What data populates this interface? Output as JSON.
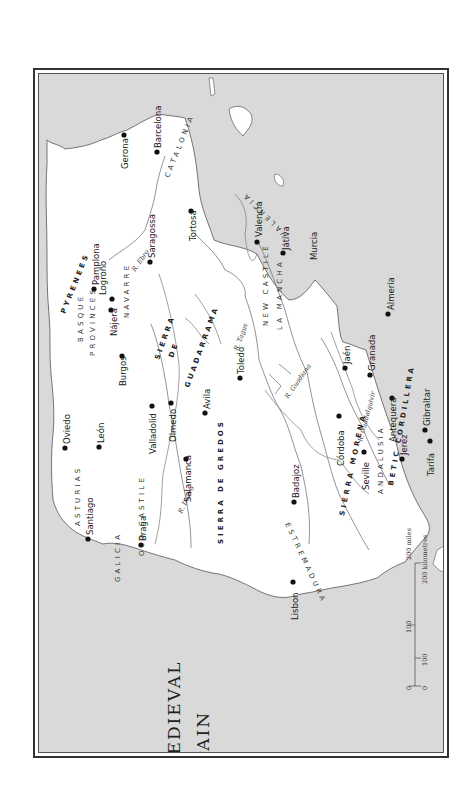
{
  "map": {
    "title_line1": "Medieval",
    "title_line2": "Spain",
    "orientation": "rotated 90° counter-clockwise (north to the left)",
    "colors": {
      "sea": "#d9d9d9",
      "land": "#ffffff",
      "border": "#333333",
      "river": "#777777",
      "city_dot": "#111111"
    },
    "cities": [
      {
        "name": "Barcelona"
      },
      {
        "name": "Gerona"
      },
      {
        "name": "Tortosa"
      },
      {
        "name": "Valencia"
      },
      {
        "name": "Játiva"
      },
      {
        "name": "Saragossa"
      },
      {
        "name": "Pamplona"
      },
      {
        "name": "Logroño"
      },
      {
        "name": "Nájera"
      },
      {
        "name": "Burgos"
      },
      {
        "name": "Murcia"
      },
      {
        "name": "Almería"
      },
      {
        "name": "Toledo"
      },
      {
        "name": "Jaén"
      },
      {
        "name": "Granada"
      },
      {
        "name": "Oviedo"
      },
      {
        "name": "León"
      },
      {
        "name": "Valladolid"
      },
      {
        "name": "Olmedo"
      },
      {
        "name": "Avila"
      },
      {
        "name": "Salamanca"
      },
      {
        "name": "Córdoba"
      },
      {
        "name": "Antequera"
      },
      {
        "name": "Gibraltar"
      },
      {
        "name": "Tarifa"
      },
      {
        "name": "Seville"
      },
      {
        "name": "Jerez"
      },
      {
        "name": "Badajoz"
      },
      {
        "name": "Santiago"
      },
      {
        "name": "Braga"
      },
      {
        "name": "Lisbon"
      }
    ],
    "regions": {
      "catalonia": "CATALONIA",
      "valencia": "VALENCIA",
      "navarre": "NAVARRE",
      "basque1": "BASQUE",
      "basque2": "PROVINCES",
      "asturias": "ASTURIAS",
      "old_castile": "OLD CASTILE",
      "new_castile": "NEW CASTILE",
      "la_mancha": "LA MANCHA",
      "galicia": "GALICIA",
      "estremadura": "ESTREMADURA",
      "andalusia": "ANDALUSIA"
    },
    "mountains": {
      "pyrenees": "PYRENEES",
      "guad1": "SIERRA",
      "guad2": "DE",
      "guad3": "GUADARRAMA",
      "gredos": "SIERRA DE GREDOS",
      "morena": "SIERRA MORENA",
      "betic": "BETIC CORDILLERA"
    },
    "rivers": {
      "ebro": "R. Ebro",
      "tagus": "R. Tagus",
      "duero": "R. Duero",
      "guadiana": "R. Guadiana",
      "guadalquivir": "R. Guadalquivir"
    },
    "scale_bar": {
      "miles_label": "200 miles",
      "km_label": "200 kilometres",
      "miles_ticks": [
        "0",
        "100"
      ],
      "km_ticks": [
        "0",
        "100"
      ]
    }
  }
}
